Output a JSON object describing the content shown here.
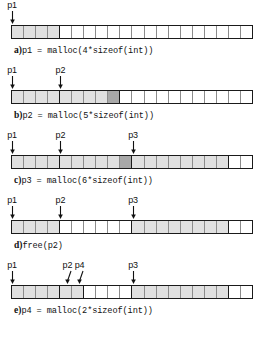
{
  "figure": {
    "cells_per_row": 20,
    "colors": {
      "allocated": "#e0e0e0",
      "allocated_dark": "#a8a8a8",
      "free": "#ffffff",
      "outline": "#1a1a1a",
      "cell_divider": "#8c8c8c",
      "text": "#111111"
    },
    "rows": [
      {
        "id": "row-a",
        "tag": "a)",
        "code": "p1 = malloc(4*sizeof(int))",
        "pointers": [
          {
            "name": "p1",
            "cell": 0,
            "slant": "none"
          }
        ],
        "cells": [
          "alloc",
          "alloc",
          "alloc",
          "alloc-bound",
          "free",
          "free",
          "free",
          "free",
          "free",
          "free",
          "free",
          "free",
          "free",
          "free",
          "free",
          "free",
          "free",
          "free",
          "free",
          "free"
        ]
      },
      {
        "id": "row-b",
        "tag": "b)",
        "code": "p2 = malloc(5*sizeof(int))",
        "pointers": [
          {
            "name": "p1",
            "cell": 0,
            "slant": "none"
          },
          {
            "name": "p2",
            "cell": 4,
            "slant": "none"
          }
        ],
        "cells": [
          "alloc",
          "alloc",
          "alloc",
          "alloc-bound",
          "alloc",
          "alloc",
          "alloc",
          "alloc",
          "allocdark-bound",
          "free",
          "free",
          "free",
          "free",
          "free",
          "free",
          "free",
          "free",
          "free",
          "free",
          "free"
        ]
      },
      {
        "id": "row-c",
        "tag": "c)",
        "code": "p3 = malloc(6*sizeof(int))",
        "pointers": [
          {
            "name": "p1",
            "cell": 0,
            "slant": "none"
          },
          {
            "name": "p2",
            "cell": 4,
            "slant": "none"
          },
          {
            "name": "p3",
            "cell": 10,
            "slant": "none"
          }
        ],
        "cells": [
          "alloc",
          "alloc",
          "alloc",
          "alloc-bound",
          "alloc",
          "alloc",
          "alloc",
          "alloc",
          "alloc",
          "allocdark-bound",
          "alloc",
          "alloc",
          "alloc",
          "alloc",
          "alloc",
          "alloc",
          "alloc",
          "alloc-bound",
          "free",
          "free"
        ]
      },
      {
        "id": "row-d",
        "tag": "d)",
        "code": "free(p2)",
        "pointers": [
          {
            "name": "p1",
            "cell": 0,
            "slant": "none"
          },
          {
            "name": "p2",
            "cell": 4,
            "slant": "none"
          },
          {
            "name": "p3",
            "cell": 10,
            "slant": "none"
          }
        ],
        "cells": [
          "alloc",
          "alloc",
          "alloc",
          "alloc-bound",
          "free",
          "free",
          "free",
          "free",
          "free",
          "free-bound",
          "alloc",
          "alloc",
          "alloc",
          "alloc",
          "alloc",
          "alloc",
          "alloc",
          "alloc-bound",
          "free",
          "free"
        ]
      },
      {
        "id": "row-e",
        "tag": "e)",
        "code": "p4 = malloc(2*sizeof(int))",
        "pointers": [
          {
            "name": "p1",
            "cell": 0,
            "slant": "none"
          },
          {
            "name": "p2",
            "cell": 4,
            "slant": "right"
          },
          {
            "name": "p4",
            "cell": 5,
            "slant": "right"
          },
          {
            "name": "p3",
            "cell": 10,
            "slant": "none"
          }
        ],
        "cells": [
          "alloc",
          "alloc",
          "alloc",
          "alloc-bound",
          "alloc",
          "alloc-bound",
          "free",
          "free",
          "free",
          "free-bound",
          "alloc",
          "alloc",
          "alloc",
          "alloc",
          "alloc",
          "alloc",
          "alloc",
          "alloc-bound",
          "free",
          "free"
        ]
      }
    ]
  }
}
